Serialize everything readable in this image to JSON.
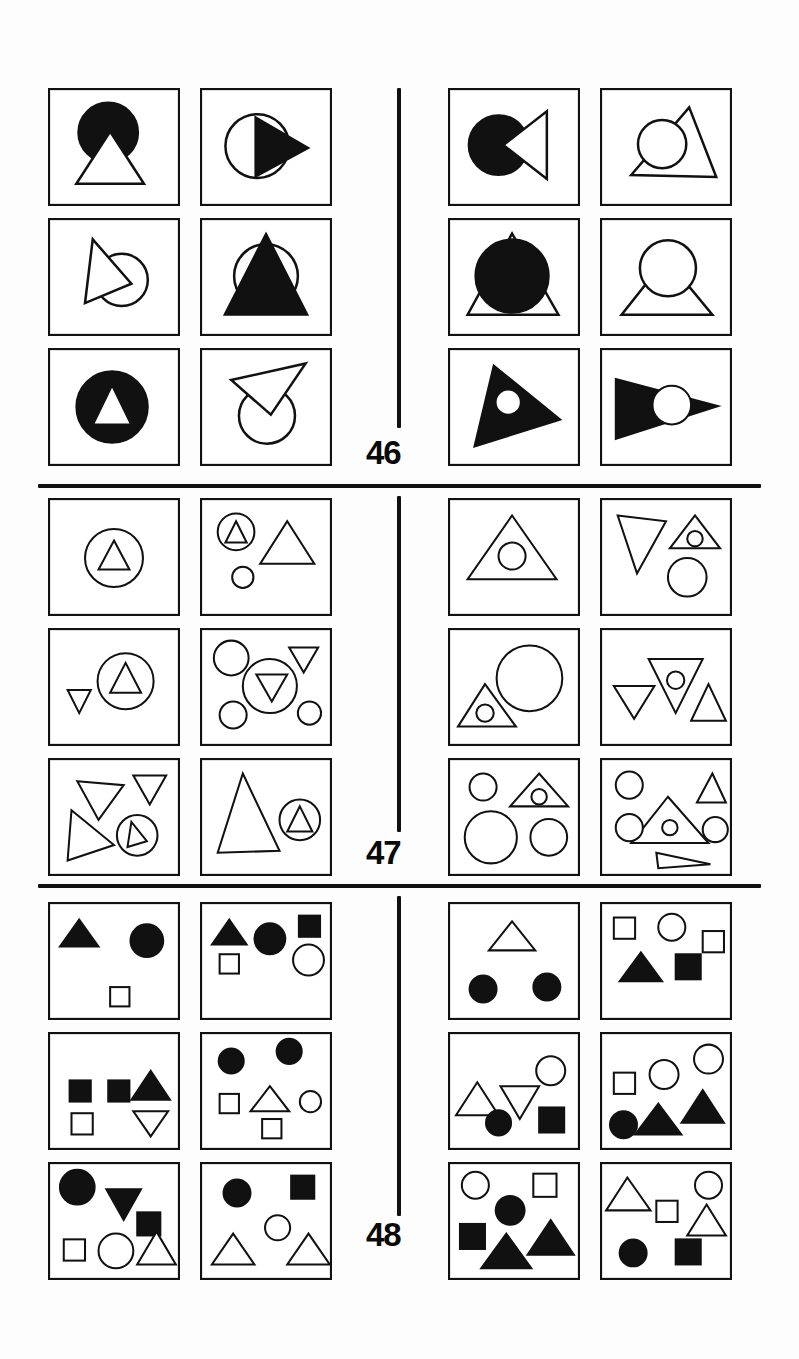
{
  "page": {
    "background_color": "#ffffff",
    "ink_color": "#111111",
    "width": 799,
    "height": 1359
  },
  "sections": [
    {
      "number": "46",
      "label_position": "bottom-center-left",
      "description": "Overlapping circle and triangle pairs, solid and outline",
      "columns": 4,
      "rows": 3,
      "panels": [
        {
          "id": "46-L-r1c1",
          "side": "left",
          "shapes": "solid circle with outline triangle overlapping lower edge"
        },
        {
          "id": "46-L-r1c2",
          "side": "left",
          "shapes": "outline circle with solid right-pointing triangle"
        },
        {
          "id": "46-L-r2c1",
          "side": "left",
          "shapes": "outline right-pointing triangle overlapping outline circle"
        },
        {
          "id": "46-L-r2c2",
          "side": "left",
          "shapes": "solid triangle over outline circle"
        },
        {
          "id": "46-L-r3c1",
          "side": "left",
          "shapes": "solid circle with knocked-out white triangle"
        },
        {
          "id": "46-L-r3c2",
          "side": "left",
          "shapes": "outline triangle pointing up-right over outline circle"
        },
        {
          "id": "46-R-r1c1",
          "side": "right",
          "shapes": "solid circle with outline bowtie triangle to the right"
        },
        {
          "id": "46-R-r1c2",
          "side": "right",
          "shapes": "outline circle inside outline triangle"
        },
        {
          "id": "46-R-r2c1",
          "side": "right",
          "shapes": "solid circle with outline triangle behind it"
        },
        {
          "id": "46-R-r2c2",
          "side": "right",
          "shapes": "outline circle above outline triangle"
        },
        {
          "id": "46-R-r3c1",
          "side": "right",
          "shapes": "solid triangle with knocked-out white circle"
        },
        {
          "id": "46-R-r3c2",
          "side": "right",
          "shapes": "solid left-pointing triangle with knocked-out white circle"
        }
      ]
    },
    {
      "number": "47",
      "label_position": "bottom-center-left",
      "description": "Outline circles and triangles, nested and scattered",
      "columns": 4,
      "rows": 3,
      "panels": [
        {
          "id": "47-L-r1c1",
          "side": "left",
          "shapes": "small outline triangle inside outline circle"
        },
        {
          "id": "47-L-r1c2",
          "side": "left",
          "shapes": "triangle in circle, large triangle, small circle"
        },
        {
          "id": "47-L-r2c1",
          "side": "left",
          "shapes": "small down triangle, triangle inside circle"
        },
        {
          "id": "47-L-r2c2",
          "side": "left",
          "shapes": "circle, down triangle in circle, down triangle, two small circles"
        },
        {
          "id": "47-L-r3c1",
          "side": "left",
          "shapes": "two down triangles, large triangle, triangle in circle"
        },
        {
          "id": "47-L-r3c2",
          "side": "left",
          "shapes": "large triangle, triangle inside circle"
        },
        {
          "id": "47-R-r1c1",
          "side": "right",
          "shapes": "circle inside large triangle"
        },
        {
          "id": "47-R-r1c2",
          "side": "right",
          "shapes": "down triangle, circle in triangle, circle"
        },
        {
          "id": "47-R-r2c1",
          "side": "right",
          "shapes": "circle inside triangle, large circle"
        },
        {
          "id": "47-R-r2c2",
          "side": "right",
          "shapes": "down triangle, circle in down triangle, up triangle"
        },
        {
          "id": "47-R-r3c1",
          "side": "right",
          "shapes": "small circle, circle in triangle, large circle, circle"
        },
        {
          "id": "47-R-r3c2",
          "side": "right",
          "shapes": "circles, triangles, circle in triangle, thin triangle"
        }
      ]
    },
    {
      "number": "48",
      "label_position": "bottom-center-left",
      "description": "Scattered small solid and outline triangles, circles and squares",
      "columns": 4,
      "rows": 3,
      "panels": [
        {
          "id": "48-L-r1c1",
          "side": "left",
          "shapes": "solid triangle, solid circle, outline square"
        },
        {
          "id": "48-L-r1c2",
          "side": "left",
          "shapes": "solid triangle, solid circle, solid square, outline square, outline circle"
        },
        {
          "id": "48-L-r2c1",
          "side": "left",
          "shapes": "two solid squares, solid triangle, outline square, outline down triangle"
        },
        {
          "id": "48-L-r2c2",
          "side": "left",
          "shapes": "two solid circles, outline square, outline triangle, outline circle, outline square"
        },
        {
          "id": "48-L-r3c1",
          "side": "left",
          "shapes": "solid circle, solid down triangle, solid square, outline square, outline circle, outline triangle"
        },
        {
          "id": "48-L-r3c2",
          "side": "left",
          "shapes": "solid circle, solid square, outline circle, two outline triangles"
        },
        {
          "id": "48-R-r1c1",
          "side": "right",
          "shapes": "outline triangle, two solid circles"
        },
        {
          "id": "48-R-r1c2",
          "side": "right",
          "shapes": "outline square, outline circle, outline square, solid triangle, solid square"
        },
        {
          "id": "48-R-r2c1",
          "side": "right",
          "shapes": "outline triangle, outline down triangle, outline circle, solid circle, solid square"
        },
        {
          "id": "48-R-r2c2",
          "side": "right",
          "shapes": "outline square, outline circle, outline circle, solid triangle, solid triangle, solid circle"
        },
        {
          "id": "48-R-r3c1",
          "side": "right",
          "shapes": "outline circle, outline square, solid circle, solid square, two solid triangles"
        },
        {
          "id": "48-R-r3c2",
          "side": "right",
          "shapes": "outline triangle, outline circle, outline square, outline triangle, solid circle, solid square"
        }
      ]
    }
  ],
  "numbers": {
    "n46": "46",
    "n47": "47",
    "n48": "48"
  }
}
